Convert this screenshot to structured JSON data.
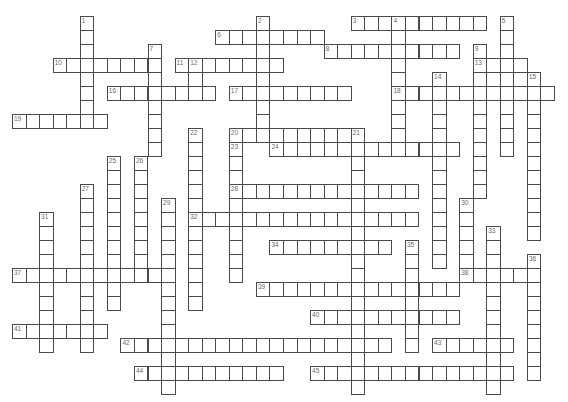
{
  "grid": {
    "origin_x": 12.5,
    "origin_y": 16.5,
    "cell_w": 13.55,
    "cell_h": 14,
    "border_color": "#4a4a4a",
    "number_color": "#6b6b6b",
    "background": "#ffffff"
  },
  "words": [
    {
      "number": "1",
      "dir": "down",
      "col": 5,
      "row": 0,
      "length": 7
    },
    {
      "number": "2",
      "dir": "down",
      "col": 18,
      "row": 0,
      "length": 9
    },
    {
      "number": "3",
      "dir": "across",
      "col": 25,
      "row": 0,
      "length": 10
    },
    {
      "number": "4",
      "dir": "down",
      "col": 28,
      "row": 0,
      "length": 10
    },
    {
      "number": "5",
      "dir": "down",
      "col": 36,
      "row": 0,
      "length": 10
    },
    {
      "number": "6",
      "dir": "across",
      "col": 15,
      "row": 1,
      "length": 8
    },
    {
      "number": "7",
      "dir": "down",
      "col": 10,
      "row": 2,
      "length": 8
    },
    {
      "number": "8",
      "dir": "across",
      "col": 23,
      "row": 2,
      "length": 10
    },
    {
      "number": "9",
      "dir": "down",
      "col": 34,
      "row": 2,
      "length": 11
    },
    {
      "number": "10",
      "dir": "across",
      "col": 3,
      "row": 3,
      "length": 8
    },
    {
      "number": "11",
      "dir": "across",
      "col": 12,
      "row": 3,
      "length": 8
    },
    {
      "number": "12",
      "dir": "down",
      "col": 13,
      "row": 3,
      "length": 3
    },
    {
      "number": "13",
      "dir": "across",
      "col": 34,
      "row": 3,
      "length": 4
    },
    {
      "number": "14",
      "dir": "down",
      "col": 31,
      "row": 4,
      "length": 14
    },
    {
      "number": "15",
      "dir": "down",
      "col": 38,
      "row": 4,
      "length": 12
    },
    {
      "number": "16",
      "dir": "across",
      "col": 7,
      "row": 5,
      "length": 8
    },
    {
      "number": "17",
      "dir": "across",
      "col": 16,
      "row": 5,
      "length": 9
    },
    {
      "number": "18",
      "dir": "across",
      "col": 28,
      "row": 5,
      "length": 12
    },
    {
      "number": "19",
      "dir": "across",
      "col": 0,
      "row": 7,
      "length": 7
    },
    {
      "number": "20",
      "dir": "across",
      "col": 16,
      "row": 8,
      "length": 10
    },
    {
      "number": "21",
      "dir": "down",
      "col": 25,
      "row": 8,
      "length": 19
    },
    {
      "number": "22",
      "dir": "down",
      "col": 13,
      "row": 8,
      "length": 13
    },
    {
      "number": "23",
      "dir": "down",
      "col": 16,
      "row": 9,
      "length": 10
    },
    {
      "number": "24",
      "dir": "across",
      "col": 19,
      "row": 9,
      "length": 14
    },
    {
      "number": "25",
      "dir": "down",
      "col": 7,
      "row": 10,
      "length": 11
    },
    {
      "number": "26",
      "dir": "down",
      "col": 9,
      "row": 10,
      "length": 9
    },
    {
      "number": "27",
      "dir": "down",
      "col": 5,
      "row": 12,
      "length": 12
    },
    {
      "number": "28",
      "dir": "across",
      "col": 16,
      "row": 12,
      "length": 14
    },
    {
      "number": "29",
      "dir": "down",
      "col": 11,
      "row": 13,
      "length": 14
    },
    {
      "number": "30",
      "dir": "down",
      "col": 33,
      "row": 13,
      "length": 5
    },
    {
      "number": "31",
      "dir": "down",
      "col": 2,
      "row": 14,
      "length": 10
    },
    {
      "number": "32",
      "dir": "across",
      "col": 13,
      "row": 14,
      "length": 17
    },
    {
      "number": "33",
      "dir": "down",
      "col": 35,
      "row": 15,
      "length": 12
    },
    {
      "number": "34",
      "dir": "across",
      "col": 19,
      "row": 16,
      "length": 9
    },
    {
      "number": "35",
      "dir": "down",
      "col": 29,
      "row": 16,
      "length": 8
    },
    {
      "number": "36",
      "dir": "down",
      "col": 38,
      "row": 17,
      "length": 9
    },
    {
      "number": "37",
      "dir": "across",
      "col": 0,
      "row": 18,
      "length": 12
    },
    {
      "number": "38",
      "dir": "across",
      "col": 33,
      "row": 18,
      "length": 6
    },
    {
      "number": "39",
      "dir": "across",
      "col": 18,
      "row": 19,
      "length": 15
    },
    {
      "number": "40",
      "dir": "across",
      "col": 22,
      "row": 21,
      "length": 11
    },
    {
      "number": "41",
      "dir": "across",
      "col": 0,
      "row": 22,
      "length": 7
    },
    {
      "number": "42",
      "dir": "across",
      "col": 8,
      "row": 23,
      "length": 20
    },
    {
      "number": "43",
      "dir": "across",
      "col": 31,
      "row": 23,
      "length": 6
    },
    {
      "number": "44",
      "dir": "across",
      "col": 9,
      "row": 25,
      "length": 11
    },
    {
      "number": "45",
      "dir": "across",
      "col": 22,
      "row": 25,
      "length": 15
    }
  ]
}
